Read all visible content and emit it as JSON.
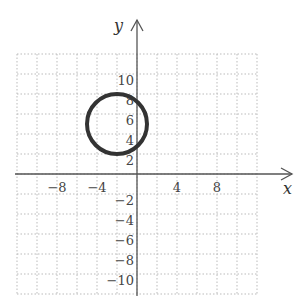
{
  "chart_data": {
    "type": "scatter",
    "title": "",
    "xlabel": "x",
    "ylabel": "y",
    "xlim": [
      -12,
      12
    ],
    "ylim": [
      -12,
      12
    ],
    "grid": true,
    "grid_step": 2,
    "grid_style": "dotted",
    "x_ticks": [
      -8,
      -4,
      4,
      8
    ],
    "x_tick_labels": [
      "−8",
      "−4",
      "4",
      "8"
    ],
    "y_ticks": [
      10,
      8,
      6,
      4,
      2,
      -2,
      -4,
      -6,
      -8,
      -10
    ],
    "y_tick_labels": [
      "10",
      "8",
      "6",
      "4",
      "2",
      "−2",
      "−4",
      "−6",
      "−8",
      "−10"
    ],
    "shapes": [
      {
        "type": "circle",
        "center": [
          -2,
          5
        ],
        "radius": 3,
        "stroke": "#333333",
        "equation": "(x+2)^2 + (y-5)^2 = 9"
      }
    ],
    "legend": null
  },
  "colors": {
    "axis": "#555555",
    "grid": "#bbbbbb",
    "curve": "#333333",
    "text": "#444444"
  }
}
